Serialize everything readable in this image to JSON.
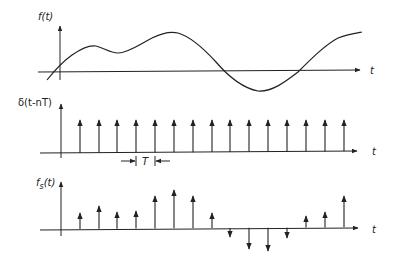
{
  "panels": {
    "top": {
      "ylabel": "f(t)",
      "xlabel": "t",
      "description": "continuous signal"
    },
    "middle": {
      "ylabel": "δ(t-nT)",
      "xlabel": "t",
      "period_label": "T",
      "description": "impulse train"
    },
    "bottom": {
      "ylabel_main": "f",
      "ylabel_sub": "s",
      "ylabel_rest": "(t)",
      "xlabel": "t",
      "description": "sampled signal"
    }
  },
  "geometry": {
    "yaxis_x": 61,
    "impulse_x": [
      80,
      99,
      117,
      136,
      155,
      174,
      193,
      212,
      230,
      249,
      268,
      287,
      306,
      325,
      344
    ],
    "top_baseline": 72,
    "mid_baseline": 153,
    "mid_tip": 120,
    "bot_baseline": 229,
    "bot_tips": [
      213,
      206,
      212,
      211,
      196,
      190,
      196,
      213,
      237,
      249,
      251,
      238,
      216,
      212,
      196
    ]
  },
  "colors": {
    "ink": "#222222",
    "background": "#ffffff"
  }
}
